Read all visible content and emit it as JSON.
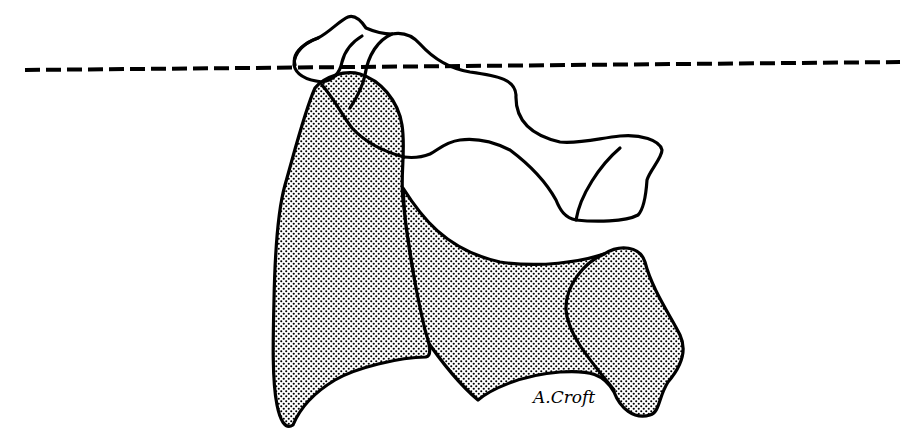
{
  "figure": {
    "signature": "A.Croft",
    "colors": {
      "line": "#000000",
      "background": "#ffffff",
      "stipple_dot": "#000000"
    },
    "elements": [
      {
        "name": "reference-line",
        "style": "dashed"
      },
      {
        "name": "upper-outline",
        "style": "unshaded"
      },
      {
        "name": "left-shaded-bone",
        "style": "stippled"
      },
      {
        "name": "lower-shaded-bone",
        "style": "stippled"
      }
    ]
  }
}
